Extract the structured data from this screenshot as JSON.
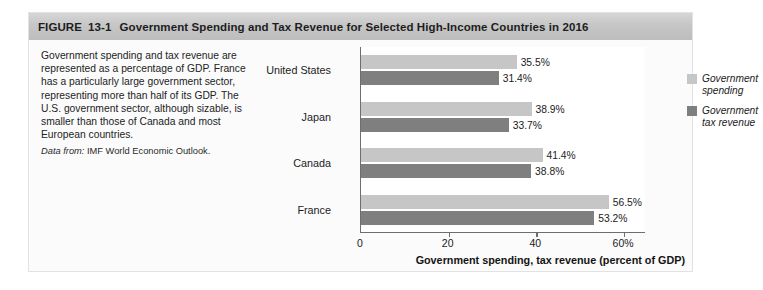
{
  "figure": {
    "label": "FIGURE",
    "number": "13-1",
    "title": "Government Spending and Tax Revenue for Selected High-Income Countries in 2016"
  },
  "caption": {
    "body": "Government spending and tax revenue are represented as a percentage of GDP. France has a particularly large government sector, representing more than half of its GDP. The U.S. government sector, although sizable, is smaller than those of Canada and most European countries.",
    "source_lead": "Data from:",
    "source_text": "IMF World Economic Outlook."
  },
  "legend": {
    "position": "right",
    "items": [
      {
        "label": "Government spending",
        "color": "#c6c6c6",
        "key": "spending"
      },
      {
        "label": "Government tax revenue",
        "color": "#7f7f7f",
        "key": "revenue"
      }
    ]
  },
  "colors": {
    "spending": "#c6c6c6",
    "revenue": "#7f7f7f",
    "axis": "#6e6e6e",
    "header_band": "#c6c6c6",
    "figure_background": "#fbfbfb"
  },
  "chart_data": {
    "type": "bar",
    "orientation": "horizontal",
    "title": "Government Spending and Tax Revenue for Selected High-Income Countries in 2016",
    "categories": [
      "United States",
      "Japan",
      "Canada",
      "France"
    ],
    "series": [
      {
        "name": "Government spending",
        "values": [
          35.5,
          38.9,
          41.4,
          56.5
        ],
        "color": "#c6c6c6"
      },
      {
        "name": "Government tax revenue",
        "values": [
          31.4,
          33.7,
          38.8,
          53.2
        ],
        "color": "#7f7f7f"
      }
    ],
    "data_labels": [
      [
        "35.5%",
        "38.9%",
        "41.4%",
        "56.5%"
      ],
      [
        "31.4%",
        "33.7%",
        "38.8%",
        "53.2%"
      ]
    ],
    "xlabel": "Government spending, tax revenue (percent of GDP)",
    "ylabel": "",
    "xlim": [
      0,
      65
    ],
    "xticks": [
      0,
      20,
      40,
      60
    ],
    "xtick_labels": [
      "0",
      "20",
      "40",
      "60%"
    ],
    "grid": false,
    "legend_position": "right",
    "units": "percent of GDP",
    "source": "IMF World Economic Outlook"
  }
}
